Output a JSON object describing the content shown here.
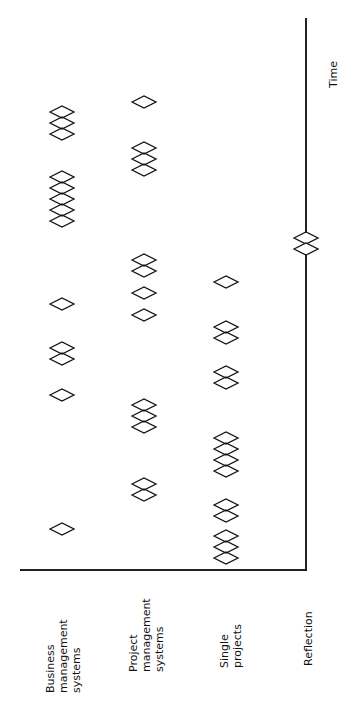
{
  "diagram": {
    "axis_label": "Time",
    "rows": [
      {
        "id": "business",
        "label": "Business\nmanagement\nsystems",
        "x": 62,
        "markers_y": [
          112,
          123,
          134,
          177,
          188,
          199,
          210,
          221,
          304,
          348,
          359,
          395,
          529
        ]
      },
      {
        "id": "project",
        "label": "Project\nmanagement\nsystems",
        "x": 144,
        "markers_y": [
          102,
          148,
          159,
          170,
          260,
          271,
          293,
          315,
          405,
          416,
          427,
          484,
          495
        ]
      },
      {
        "id": "single",
        "label": "Single\nprojects",
        "x": 226,
        "markers_y": [
          282,
          327,
          338,
          372,
          383,
          438,
          449,
          460,
          471,
          505,
          516,
          536,
          547,
          558
        ]
      },
      {
        "id": "reflection",
        "label": "Reflection",
        "x": 306,
        "markers_y": [
          238,
          249
        ]
      }
    ],
    "marker_shape": "diamond-outline",
    "stroke_color": "#111111"
  }
}
